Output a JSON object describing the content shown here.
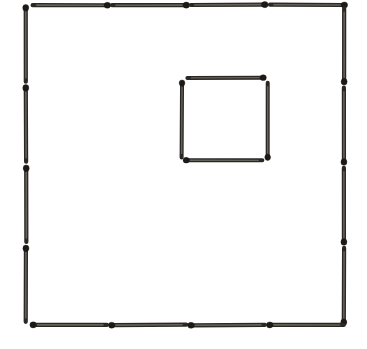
{
  "figure": {
    "description": "A large square outlined by sixteen matches, four along each side, enclosing a small square made of four matches set above and right of centre.",
    "canvas": {
      "width": 367,
      "height": 349,
      "background": "#ffffff"
    },
    "colors": {
      "stick": "#2b2824",
      "stick_core": "#6e6a64",
      "head": "#1c1917",
      "background": "#ffffff"
    },
    "counts": {
      "total_matches": "20",
      "outer_square_matches": "16",
      "inner_square_matches": "4",
      "matches_per_outer_side": "4"
    },
    "groups": [
      {
        "name": "outer-square-top",
        "label": "Top side of large square",
        "orientation": "horizontal",
        "count": "4",
        "matches": [
          {
            "id": "top-1",
            "x1": 33,
            "y1": 5,
            "x2": 107,
            "y2": 5,
            "head": "end",
            "thickness": 4.2
          },
          {
            "id": "top-2",
            "x1": 112,
            "y1": 5,
            "x2": 186,
            "y2": 5,
            "head": "end",
            "thickness": 4.2
          },
          {
            "id": "top-3",
            "x1": 191,
            "y1": 5,
            "x2": 265,
            "y2": 5,
            "head": "end",
            "thickness": 4.2
          },
          {
            "id": "top-4",
            "x1": 270,
            "y1": 5,
            "x2": 344,
            "y2": 5,
            "head": "end",
            "thickness": 4.2
          }
        ]
      },
      {
        "name": "outer-square-left",
        "label": "Left side of large square",
        "orientation": "vertical",
        "count": "4",
        "matches": [
          {
            "id": "left-1",
            "x1": 26,
            "y1": 8,
            "x2": 26,
            "y2": 82,
            "head": "start",
            "thickness": 4.2
          },
          {
            "id": "left-2",
            "x1": 26,
            "y1": 88,
            "x2": 26,
            "y2": 162,
            "head": "start",
            "thickness": 4.2
          },
          {
            "id": "left-3",
            "x1": 26,
            "y1": 168,
            "x2": 26,
            "y2": 242,
            "head": "start",
            "thickness": 4.2
          },
          {
            "id": "left-4",
            "x1": 26,
            "y1": 248,
            "x2": 26,
            "y2": 322,
            "head": "start",
            "thickness": 4.2
          }
        ]
      },
      {
        "name": "outer-square-right",
        "label": "Right side of large square",
        "orientation": "vertical",
        "count": "4",
        "matches": [
          {
            "id": "right-1",
            "x1": 344,
            "y1": 8,
            "x2": 344,
            "y2": 82,
            "head": "end",
            "thickness": 4.2
          },
          {
            "id": "right-2",
            "x1": 344,
            "y1": 88,
            "x2": 344,
            "y2": 162,
            "head": "end",
            "thickness": 4.2
          },
          {
            "id": "right-3",
            "x1": 344,
            "y1": 168,
            "x2": 344,
            "y2": 242,
            "head": "end",
            "thickness": 4.2
          },
          {
            "id": "right-4",
            "x1": 344,
            "y1": 248,
            "x2": 344,
            "y2": 322,
            "head": "end",
            "thickness": 4.2
          }
        ]
      },
      {
        "name": "outer-square-bottom",
        "label": "Bottom side of large square",
        "orientation": "horizontal",
        "count": "4",
        "matches": [
          {
            "id": "bottom-1",
            "x1": 33,
            "y1": 325,
            "x2": 107,
            "y2": 325,
            "head": "start",
            "thickness": 4.2
          },
          {
            "id": "bottom-2",
            "x1": 112,
            "y1": 325,
            "x2": 186,
            "y2": 325,
            "head": "start",
            "thickness": 4.2
          },
          {
            "id": "bottom-3",
            "x1": 191,
            "y1": 325,
            "x2": 265,
            "y2": 325,
            "head": "start",
            "thickness": 4.2
          },
          {
            "id": "bottom-4",
            "x1": 270,
            "y1": 325,
            "x2": 344,
            "y2": 325,
            "head": "start",
            "thickness": 4.2
          }
        ]
      },
      {
        "name": "inner-square",
        "label": "Small inner square",
        "orientation": "mixed",
        "count": "4",
        "matches": [
          {
            "id": "inner-top",
            "x1": 187,
            "y1": 78,
            "x2": 263,
            "y2": 78,
            "head": "end",
            "thickness": 4.0
          },
          {
            "id": "inner-right",
            "x1": 268,
            "y1": 83,
            "x2": 268,
            "y2": 157,
            "head": "end",
            "thickness": 4.0
          },
          {
            "id": "inner-bottom",
            "x1": 186,
            "y1": 160,
            "x2": 262,
            "y2": 160,
            "head": "start",
            "thickness": 4.0
          },
          {
            "id": "inner-left",
            "x1": 182,
            "y1": 83,
            "x2": 182,
            "y2": 157,
            "head": "start",
            "thickness": 4.0
          }
        ]
      }
    ]
  }
}
